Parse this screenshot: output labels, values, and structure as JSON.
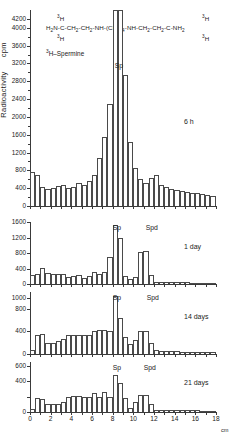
{
  "figure": {
    "y_axis_title": "Radioactivity",
    "y_axis_units": "cpm",
    "x_axis_units": "cm",
    "compound_name": "3H-Spermine",
    "formula": "H2N-C-CH2-CH2-NH-(CH2)4-NH-CH2-CH2-C-NH2",
    "formula_label_left": "3H",
    "formula_label_left2": "3H",
    "formula_label_right": "3H",
    "formula_label_right2": "3H"
  },
  "chart_data": {
    "type": "bar",
    "xlabel": "cm",
    "ylabel": "Radioactivity  cpm",
    "grid": false,
    "panels": [
      {
        "id": "panel-6h",
        "time_label": "6 h",
        "ylim": [
          0,
          4400
        ],
        "yticks": [
          0,
          400,
          800,
          1200,
          1600,
          2000,
          2400,
          2800,
          3200,
          3600,
          4000,
          4200
        ],
        "ytick_labels": [
          "0",
          "400",
          "800",
          "1200",
          "1600",
          "2000",
          "2400",
          "2800",
          "3200",
          "3600",
          "4000",
          "4200"
        ],
        "peak_labels": [
          {
            "text": "Sp",
            "x_cm": 8.2
          }
        ],
        "x": [
          0.25,
          0.75,
          1.25,
          1.75,
          2.25,
          2.75,
          3.25,
          3.75,
          4.25,
          4.75,
          5.25,
          5.75,
          6.25,
          6.75,
          7.25,
          7.75,
          8.25,
          8.75,
          9.25,
          9.75,
          10.25,
          10.75,
          11.25,
          11.75,
          12.25,
          12.75,
          13.25,
          13.75,
          14.25,
          14.75,
          15.25,
          15.75,
          16.25,
          16.75,
          17.25,
          17.75
        ],
        "values": [
          760,
          690,
          430,
          380,
          410,
          440,
          480,
          400,
          430,
          520,
          470,
          560,
          700,
          1080,
          1560,
          2300,
          4400,
          4400,
          2950,
          1430,
          850,
          600,
          520,
          640,
          700,
          480,
          430,
          390,
          370,
          340,
          320,
          300,
          290,
          270,
          250,
          230
        ]
      },
      {
        "id": "panel-1day",
        "time_label": "1 day",
        "ylim": [
          0,
          1600
        ],
        "yticks": [
          0,
          400,
          800,
          1200,
          1600
        ],
        "ytick_labels": [
          "0",
          "400",
          "800",
          "1200",
          "1600"
        ],
        "peak_labels": [
          {
            "text": "Sp",
            "x_cm": 8.0
          },
          {
            "text": "Spd",
            "x_cm": 11.2
          }
        ],
        "x": [
          0.25,
          0.75,
          1.25,
          1.75,
          2.25,
          2.75,
          3.25,
          3.75,
          4.25,
          4.75,
          5.25,
          5.75,
          6.25,
          6.75,
          7.25,
          7.75,
          8.25,
          8.75,
          9.25,
          9.75,
          10.25,
          10.75,
          11.25,
          11.75,
          12.25,
          12.75,
          13.25,
          13.75,
          14.25,
          14.75,
          15.25,
          15.75,
          16.25,
          16.75,
          17.25,
          17.75
        ],
        "values": [
          220,
          270,
          410,
          290,
          250,
          250,
          260,
          170,
          200,
          230,
          150,
          210,
          300,
          260,
          320,
          690,
          1520,
          1200,
          200,
          130,
          170,
          820,
          840,
          220,
          60,
          50,
          50,
          45,
          45,
          40,
          40,
          38,
          36,
          34,
          32,
          30
        ]
      },
      {
        "id": "panel-14days",
        "time_label": "14 days",
        "ylim": [
          0,
          1100
        ],
        "yticks": [
          0,
          400,
          800,
          1000
        ],
        "ytick_labels": [
          "0",
          "400",
          "800",
          "1000"
        ],
        "peak_labels": [
          {
            "text": "Sp",
            "x_cm": 8.0
          },
          {
            "text": "Spd",
            "x_cm": 11.3
          }
        ],
        "x": [
          0.25,
          0.75,
          1.25,
          1.75,
          2.25,
          2.75,
          3.25,
          3.75,
          4.25,
          4.75,
          5.25,
          5.75,
          6.25,
          6.75,
          7.25,
          7.75,
          8.25,
          8.75,
          9.25,
          9.75,
          10.25,
          10.75,
          11.25,
          11.75,
          12.25,
          12.75,
          13.25,
          13.75,
          14.25,
          14.75,
          15.25,
          15.75,
          16.25,
          16.75,
          17.25,
          17.75
        ],
        "values": [
          80,
          330,
          360,
          190,
          200,
          230,
          270,
          330,
          330,
          330,
          330,
          330,
          400,
          420,
          420,
          410,
          1030,
          640,
          300,
          170,
          250,
          400,
          400,
          190,
          70,
          55,
          50,
          48,
          45,
          43,
          40,
          38,
          36,
          34,
          32,
          30
        ]
      },
      {
        "id": "panel-21days",
        "time_label": "21 days",
        "ylim": [
          0,
          650
        ],
        "yticks": [
          0,
          200,
          400,
          600
        ],
        "ytick_labels": [
          "0",
          "",
          "400",
          "600"
        ],
        "peak_labels": [
          {
            "text": "Sp",
            "x_cm": 8.0
          },
          {
            "text": "Spd",
            "x_cm": 11.0
          }
        ],
        "x": [
          0.25,
          0.75,
          1.25,
          1.75,
          2.25,
          2.75,
          3.25,
          3.75,
          4.25,
          4.75,
          5.25,
          5.75,
          6.25,
          6.75,
          7.25,
          7.75,
          8.25,
          8.75,
          9.25,
          9.75,
          10.25,
          10.75,
          11.25,
          11.75,
          12.25,
          12.75,
          13.25,
          13.75,
          14.25,
          14.75,
          15.25,
          15.75,
          16.25,
          16.75,
          17.25,
          17.75
        ],
        "values": [
          45,
          180,
          175,
          110,
          100,
          110,
          130,
          200,
          205,
          205,
          200,
          195,
          250,
          200,
          265,
          200,
          480,
          380,
          185,
          55,
          130,
          215,
          215,
          100,
          30,
          28,
          26,
          25,
          24,
          23,
          22,
          21,
          20,
          19,
          18,
          17
        ]
      }
    ],
    "xticks": [
      0,
      1,
      2,
      3,
      4,
      5,
      6,
      7,
      8,
      9,
      10,
      11,
      12,
      13,
      14,
      15,
      16,
      17,
      18
    ],
    "xtick_labels": [
      "0",
      "",
      "2",
      "",
      "4",
      "",
      "6",
      "",
      "8",
      "",
      "10",
      "",
      "12",
      "",
      "14",
      "",
      "16",
      "",
      "18"
    ]
  }
}
